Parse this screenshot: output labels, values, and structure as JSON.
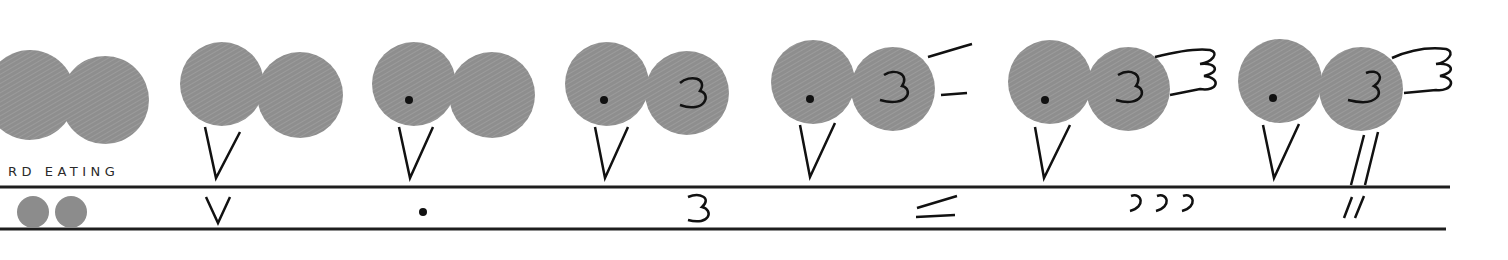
{
  "title": "RD EATING",
  "colors": {
    "fill": "#8c8c8c",
    "ink": "#111111",
    "line": "#1e1e1e",
    "background": "#ffffff"
  },
  "steps": [
    {
      "index": 1,
      "name": "two circles",
      "symbol": "two-dots",
      "symbol_text": ""
    },
    {
      "index": 2,
      "name": "add beak",
      "symbol": "v",
      "symbol_text": "V"
    },
    {
      "index": 3,
      "name": "add eye",
      "symbol": "dot",
      "symbol_text": "•"
    },
    {
      "index": 4,
      "name": "add wing curve",
      "symbol": "three",
      "symbol_text": "3"
    },
    {
      "index": 5,
      "name": "add tail lines",
      "symbol": "lines",
      "symbol_text": "≤"
    },
    {
      "index": 6,
      "name": "add tail feathers",
      "symbol": "curls",
      "symbol_text": "ɔɔɔ"
    },
    {
      "index": 7,
      "name": "add legs",
      "symbol": "legs",
      "symbol_text": "//"
    }
  ]
}
